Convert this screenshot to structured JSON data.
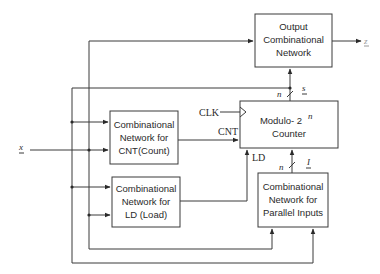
{
  "diagram": {
    "blocks": {
      "output": {
        "lines": [
          "Output",
          "Combinational",
          "Network"
        ]
      },
      "counter": {
        "line1": "Modulo- 2",
        "superscript": "n",
        "line2": "Counter"
      },
      "cnt": {
        "lines": [
          "Combinational",
          "Network for",
          "CNT(Count)"
        ]
      },
      "ld": {
        "lines": [
          "Combinational",
          "Network for",
          "LD (Load)"
        ]
      },
      "parallel": {
        "lines": [
          "Combinational",
          "Network for",
          "Parallel Inputs"
        ]
      }
    },
    "signals": {
      "input_x": "x",
      "output_z": "z",
      "clk": "CLK",
      "cnt": "CNT",
      "ld": "LD",
      "state_s": "s",
      "state_width": "n",
      "parallel_i": "I",
      "parallel_width": "n"
    },
    "colors": {
      "line": "#3a3a3a",
      "text": "#2a2a2a",
      "background": "#ffffff"
    }
  }
}
